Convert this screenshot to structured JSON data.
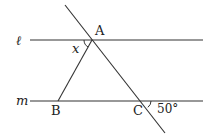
{
  "figure": {
    "type": "geometry",
    "line_color": "#333333",
    "background": "#ffffff"
  },
  "lines": {
    "l": {
      "label": "ℓ",
      "x1": 30,
      "y1": 40,
      "x2": 203,
      "y2": 40
    },
    "m": {
      "label": "m",
      "x1": 30,
      "y1": 101,
      "x2": 203,
      "y2": 101
    },
    "transversal": {
      "x1": 65,
      "y1": 5,
      "x2": 165,
      "y2": 133
    },
    "segment_ab": {
      "x1": 92,
      "y1": 40,
      "x2": 58,
      "y2": 101
    }
  },
  "points": {
    "A": {
      "label": "A",
      "x": 92,
      "y": 40
    },
    "B": {
      "label": "B",
      "x": 58,
      "y": 101
    },
    "C": {
      "label": "C",
      "x": 143,
      "y": 101
    }
  },
  "angles": {
    "x": {
      "label": "x",
      "vertex": "A",
      "description": "angle between line l (left) and segment AB"
    },
    "c_exterior": {
      "label": "50°",
      "vertex": "C",
      "value_degrees": 50,
      "description": "angle between line m (right) and transversal below m"
    }
  }
}
